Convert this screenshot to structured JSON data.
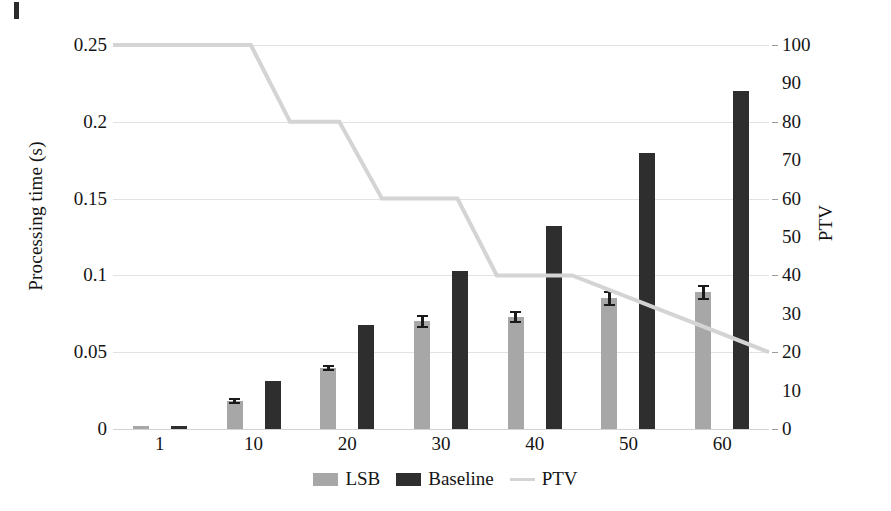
{
  "chart_data": {
    "type": "bar",
    "title": "",
    "xlabel": "",
    "ylabel": "Processing time (s)",
    "y2label": "PTV",
    "categories": [
      "1",
      "10",
      "20",
      "30",
      "40",
      "50",
      "60"
    ],
    "ylim": [
      0,
      0.25
    ],
    "y2lim": [
      0,
      100
    ],
    "yticks": [
      "0",
      "0.05",
      "0.1",
      "0.15",
      "0.2",
      "0.25"
    ],
    "ytick_values": [
      0,
      0.05,
      0.1,
      0.15,
      0.2,
      0.25
    ],
    "y2ticks": [
      "0",
      "10",
      "20",
      "30",
      "40",
      "50",
      "60",
      "70",
      "80",
      "90",
      "100"
    ],
    "y2tick_values": [
      0,
      10,
      20,
      30,
      40,
      50,
      60,
      70,
      80,
      90,
      100
    ],
    "grid": true,
    "legend_position": "bottom",
    "series": [
      {
        "name": "LSB",
        "kind": "bar",
        "axis": "left",
        "color": "#a7a7a7",
        "values": [
          0.002,
          0.018,
          0.04,
          0.07,
          0.073,
          0.085,
          0.089
        ],
        "errors": [
          0.0,
          0.002,
          0.002,
          0.004,
          0.004,
          0.005,
          0.005
        ]
      },
      {
        "name": "Baseline",
        "kind": "bar",
        "axis": "left",
        "color": "#2e2e2e",
        "values": [
          0.002,
          0.031,
          0.068,
          0.103,
          0.132,
          0.18,
          0.22
        ],
        "errors": [
          0,
          0,
          0,
          0,
          0,
          0,
          0
        ]
      },
      {
        "name": "PTV",
        "kind": "step-line",
        "axis": "right",
        "color": "#d4d4d4",
        "step_x": [
          0.0,
          0.21,
          0.27,
          0.345,
          0.41,
          0.525,
          0.585,
          0.7,
          1.0
        ],
        "step_y": [
          100,
          100,
          80,
          80,
          60,
          60,
          40,
          40,
          20
        ],
        "values": [
          100,
          80,
          60,
          60,
          40,
          20,
          20
        ]
      }
    ]
  },
  "legend": {
    "items": [
      {
        "label": "LSB",
        "swatch": "lsb"
      },
      {
        "label": "Baseline",
        "swatch": "baseline"
      },
      {
        "label": "PTV",
        "swatch": "ptv"
      }
    ]
  }
}
